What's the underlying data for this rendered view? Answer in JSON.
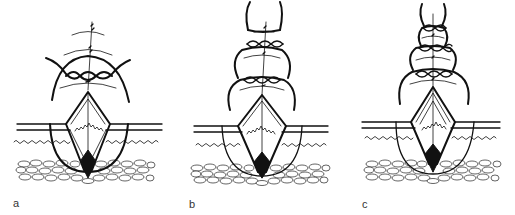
{
  "figure": {
    "ink_color": "#111111",
    "background": "#ffffff",
    "panels": [
      {
        "id": "a",
        "label": "a",
        "center_x": 88,
        "apex_y": 92,
        "skin_y": 124,
        "suture_loops": 1,
        "knot_marks": 3
      },
      {
        "id": "b",
        "label": "b",
        "center_x": 262,
        "apex_y": 95,
        "skin_y": 126,
        "suture_loops": 3,
        "knot_marks": 3
      },
      {
        "id": "c",
        "label": "c",
        "center_x": 433,
        "apex_y": 87,
        "skin_y": 122,
        "suture_loops": 4,
        "knot_marks": 3
      }
    ]
  }
}
